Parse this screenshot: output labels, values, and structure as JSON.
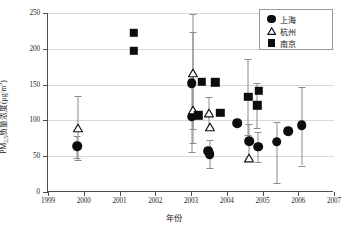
{
  "chart_data": {
    "type": "scatter",
    "title": "",
    "xlabel": "年份",
    "ylabel_parts": {
      "pre": "PM",
      "sub": "2.5",
      "mid": "质量浓度(μg/m",
      "sup": "3",
      "post": ")"
    },
    "ylabel": "PM2.5质量浓度(μg/m3)",
    "xlim": [
      1999,
      2007
    ],
    "ylim": [
      0,
      250
    ],
    "xticks": [
      1999,
      2000,
      2001,
      2002,
      2003,
      2004,
      2005,
      2006,
      2007
    ],
    "yticks": [
      0,
      50,
      100,
      150,
      200,
      250
    ],
    "grid": "horizontal",
    "legend_position": "top-right",
    "series": [
      {
        "name": "上海",
        "marker": "filled-circle",
        "color": "#0d0d0d",
        "points": [
          {
            "x": 1999.82,
            "y": 64,
            "yerr_low": 48,
            "yerr_high": 78
          },
          {
            "x": 2003.02,
            "y": 152,
            "yerr_low": 152,
            "yerr_high": 152
          },
          {
            "x": 2003.02,
            "y": 105,
            "yerr_low": 56,
            "yerr_high": 155
          },
          {
            "x": 2003.48,
            "y": 57,
            "yerr_low": 57,
            "yerr_high": 57
          },
          {
            "x": 2003.52,
            "y": 53,
            "yerr_low": 34,
            "yerr_high": 72
          },
          {
            "x": 2004.3,
            "y": 96,
            "yerr_low": 96,
            "yerr_high": 96
          },
          {
            "x": 2004.62,
            "y": 71,
            "yerr_low": 48,
            "yerr_high": 95
          },
          {
            "x": 2004.88,
            "y": 63,
            "yerr_low": 42,
            "yerr_high": 84
          },
          {
            "x": 2005.4,
            "y": 70,
            "yerr_low": 12,
            "yerr_high": 98
          },
          {
            "x": 2005.72,
            "y": 85,
            "yerr_low": 85,
            "yerr_high": 85
          },
          {
            "x": 2006.1,
            "y": 93,
            "yerr_low": 37,
            "yerr_high": 147
          }
        ]
      },
      {
        "name": "杭州",
        "marker": "open-triangle",
        "color": "#ffffff",
        "points": [
          {
            "x": 1999.85,
            "y": 91,
            "yerr_low": 44,
            "yerr_high": 134
          },
          {
            "x": 2003.05,
            "y": 168,
            "yerr_low": 88,
            "yerr_high": 248
          },
          {
            "x": 2003.05,
            "y": 116,
            "yerr_low": 68,
            "yerr_high": 224
          },
          {
            "x": 2003.5,
            "y": 111,
            "yerr_low": 86,
            "yerr_high": 133
          },
          {
            "x": 2003.52,
            "y": 92,
            "yerr_low": 92,
            "yerr_high": 92
          },
          {
            "x": 2004.62,
            "y": 48,
            "yerr_low": 48,
            "yerr_high": 48
          }
        ]
      },
      {
        "name": "南京",
        "marker": "filled-square",
        "color": "#0d0d0d",
        "points": [
          {
            "x": 2001.4,
            "y": 222,
            "yerr_low": 222,
            "yerr_high": 222
          },
          {
            "x": 2001.4,
            "y": 197,
            "yerr_low": 197,
            "yerr_high": 197
          },
          {
            "x": 2003.3,
            "y": 154,
            "yerr_low": 154,
            "yerr_high": 154
          },
          {
            "x": 2003.2,
            "y": 107,
            "yerr_low": 107,
            "yerr_high": 107
          },
          {
            "x": 2003.68,
            "y": 153,
            "yerr_low": 153,
            "yerr_high": 153
          },
          {
            "x": 2003.82,
            "y": 111,
            "yerr_low": 111,
            "yerr_high": 111
          },
          {
            "x": 2004.6,
            "y": 133,
            "yerr_low": 80,
            "yerr_high": 186
          },
          {
            "x": 2004.9,
            "y": 141,
            "yerr_low": 141,
            "yerr_high": 141
          },
          {
            "x": 2004.86,
            "y": 121,
            "yerr_low": 89,
            "yerr_high": 152
          }
        ]
      }
    ]
  },
  "legend": {
    "entries": [
      {
        "label": "上海",
        "marker": "filled-circle"
      },
      {
        "label": "杭州",
        "marker": "open-triangle"
      },
      {
        "label": "南京",
        "marker": "filled-square"
      }
    ]
  },
  "axes": {
    "x_title": "年份",
    "y_title_pre": "PM",
    "y_title_sub": "2.5",
    "y_title_mid": "质量浓度(μg/m",
    "y_title_sup": "3",
    "y_title_post": ")"
  }
}
